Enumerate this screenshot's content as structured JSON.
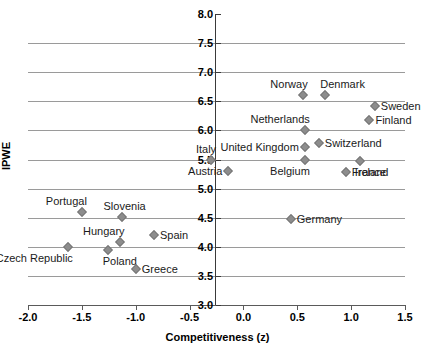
{
  "chart_data": {
    "type": "scatter",
    "title": "",
    "xlabel": "Competitiveness (z)",
    "ylabel": "IPWE",
    "xlim": [
      -2.0,
      1.5
    ],
    "ylim": [
      3.0,
      8.0
    ],
    "xticks": [
      "-2.0",
      "-1.5",
      "-1.0",
      "-0.5",
      "0.0",
      "0.5",
      "1.0",
      "1.5"
    ],
    "xtick_values": [
      -2.0,
      -1.5,
      -1.0,
      -0.5,
      0.0,
      0.5,
      1.0,
      1.5
    ],
    "yticks": [
      "8.0",
      "7.5",
      "7.0",
      "6.5",
      "6.0",
      "5.5",
      "5.0",
      "4.5",
      "4.0",
      "3.5",
      "3.0"
    ],
    "ytick_values": [
      8.0,
      7.5,
      7.0,
      6.5,
      6.0,
      5.5,
      5.0,
      4.5,
      4.0,
      3.5,
      3.0
    ],
    "gridlines": [
      7.5,
      7.0,
      6.5,
      6.0,
      5.5,
      5.0,
      4.5,
      4.0,
      3.5
    ],
    "grid": true,
    "legend": "none",
    "marker": "diamond",
    "marker_color": "#8d8d8d",
    "points": [
      {
        "label": "Norway",
        "x": 0.55,
        "y": 6.6,
        "label_pos": "above-left"
      },
      {
        "label": "Denmark",
        "x": 0.76,
        "y": 6.6,
        "label_pos": "above-right"
      },
      {
        "label": "Sweden",
        "x": 1.22,
        "y": 6.42,
        "label_pos": "right"
      },
      {
        "label": "Finland",
        "x": 1.17,
        "y": 6.18,
        "label_pos": "right"
      },
      {
        "label": "Netherlands",
        "x": 0.57,
        "y": 6.0,
        "label_pos": "above-left"
      },
      {
        "label": "Switzerland",
        "x": 0.7,
        "y": 5.78,
        "label_pos": "right"
      },
      {
        "label": "United Kingdom",
        "x": 0.57,
        "y": 5.72,
        "label_pos": "left"
      },
      {
        "label": "Belgium",
        "x": 0.57,
        "y": 5.5,
        "label_pos": "below-left"
      },
      {
        "label": "Ireland",
        "x": 1.08,
        "y": 5.48,
        "label_pos": "below-right"
      },
      {
        "label": "France",
        "x": 0.95,
        "y": 5.28,
        "label_pos": "right"
      },
      {
        "label": "Italy",
        "x": -0.3,
        "y": 5.5,
        "label_pos": "above-left"
      },
      {
        "label": "Austria",
        "x": -0.14,
        "y": 5.3,
        "label_pos": "left"
      },
      {
        "label": "Portugal",
        "x": -1.5,
        "y": 4.6,
        "label_pos": "above-left"
      },
      {
        "label": "Slovenia",
        "x": -1.13,
        "y": 4.52,
        "label_pos": "above"
      },
      {
        "label": "Germany",
        "x": 0.44,
        "y": 4.47,
        "label_pos": "right"
      },
      {
        "label": "Spain",
        "x": -0.83,
        "y": 4.2,
        "label_pos": "right"
      },
      {
        "label": "Hungary",
        "x": -1.15,
        "y": 4.08,
        "label_pos": "above-left"
      },
      {
        "label": "Czech Republic",
        "x": -1.63,
        "y": 4.0,
        "label_pos": "below-left"
      },
      {
        "label": "Poland",
        "x": -1.26,
        "y": 3.95,
        "label_pos": "below-right"
      },
      {
        "label": "Greece",
        "x": -1.0,
        "y": 3.62,
        "label_pos": "right"
      }
    ]
  }
}
